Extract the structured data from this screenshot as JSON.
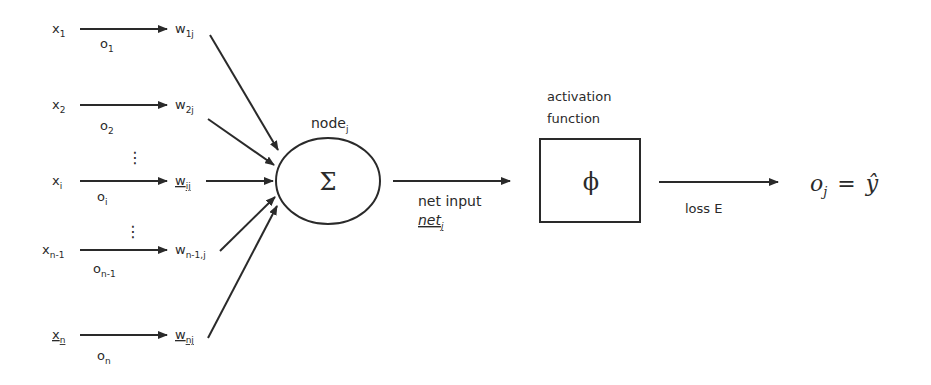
{
  "inputs": [
    {
      "x": "x",
      "x_sub": "1",
      "o": "o",
      "o_sub": "1",
      "w": "w",
      "w_sub": "1j"
    },
    {
      "x": "x",
      "x_sub": "2",
      "o": "o",
      "o_sub": "2",
      "w": "w",
      "w_sub": "2j"
    },
    {
      "x": "x",
      "x_sub": "i",
      "o": "o",
      "o_sub": "i",
      "w": "w",
      "w_sub": "ij"
    },
    {
      "x": "x",
      "x_sub": "n-1",
      "o": "o",
      "o_sub": "n-1",
      "w": "w",
      "w_sub": "n-1,j"
    },
    {
      "x": "x",
      "x_sub": "n",
      "o": "o",
      "o_sub": "n",
      "w": "w",
      "w_sub": "nj"
    }
  ],
  "ellipsis": "⋮",
  "node": {
    "label": "node",
    "label_sub": "j",
    "symbol": "Σ"
  },
  "net_input": {
    "label": "net input",
    "var": "net",
    "var_sub": "j"
  },
  "activation": {
    "title_line1": "activation",
    "title_line2": "function",
    "symbol": "ϕ"
  },
  "loss": {
    "label": "loss E"
  },
  "output": {
    "lhs": "o",
    "lhs_sub": "j",
    "eq": "=",
    "rhs": "ŷ"
  },
  "colors": {
    "ink": "#2a2a2a",
    "background": "#ffffff"
  }
}
